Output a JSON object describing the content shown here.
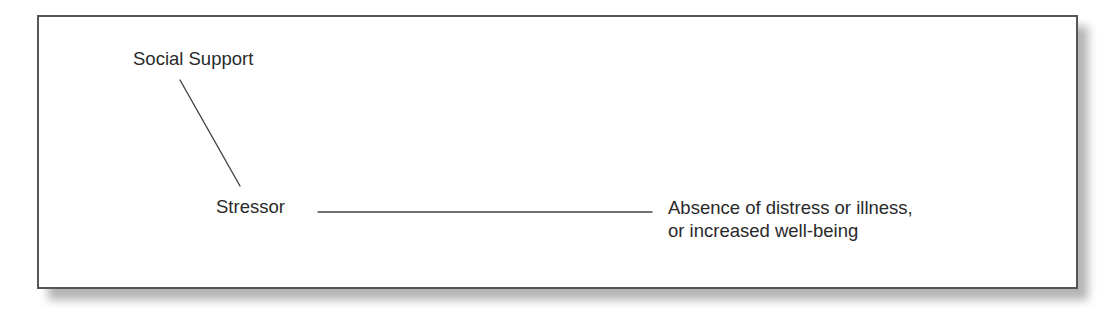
{
  "diagram": {
    "type": "buffering-model",
    "nodes": {
      "moderator": {
        "label": "Social Support"
      },
      "predictor": {
        "label": "Stressor"
      },
      "outcome": {
        "lines": [
          "Absence of distress or illness,",
          "or increased well-being"
        ]
      }
    },
    "edges": [
      {
        "from": "Social Support",
        "to": "Stressor",
        "style": "line"
      },
      {
        "from": "Stressor",
        "to": "Absence of distress or illness, or increased well-being",
        "style": "line"
      }
    ],
    "colors": {
      "text": "#2a2a2a",
      "line": "#444444",
      "frame_border": "#555555",
      "shadow": "#9a9a9a",
      "background": "#ffffff"
    }
  }
}
